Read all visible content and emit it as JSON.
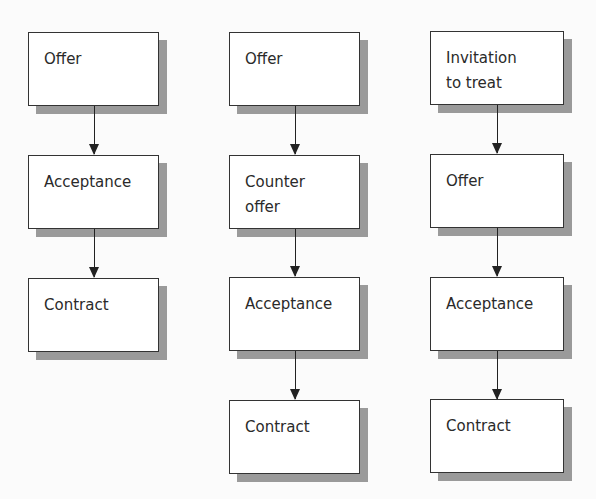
{
  "diagram": {
    "columns": [
      {
        "boxes": [
          "Offer",
          "Acceptance",
          "Contract"
        ]
      },
      {
        "boxes": [
          "Offer",
          "Counter\noffer",
          "Acceptance",
          "Contract"
        ]
      },
      {
        "boxes": [
          "Invitation\nto treat",
          "Offer",
          "Acceptance",
          "Contract"
        ]
      }
    ]
  },
  "colors": {
    "border": "#333333",
    "shadow": "#9a9a9a",
    "arrow": "#222222"
  }
}
